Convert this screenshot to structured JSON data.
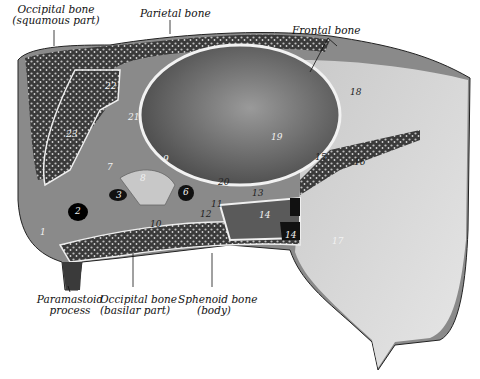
{
  "figure": {
    "style": "grayscale engraving"
  },
  "labels": {
    "occipital_squamous": {
      "line1": "Occipital bone",
      "line2": "(squamous part)"
    },
    "parietal": {
      "line1": "Parietal bone"
    },
    "frontal": {
      "line1": "Frontal bone"
    },
    "paramastoid": {
      "line1": "Paramastoid",
      "line2": "process"
    },
    "occipital_basilar": {
      "line1": "Occipital bone",
      "line2": "(basilar part)"
    },
    "sphenoid_body": {
      "line1": "Sphenoid bone",
      "line2": "(body)"
    }
  },
  "numbers": [
    {
      "id": "n1",
      "text": "1"
    },
    {
      "id": "n2",
      "text": "2"
    },
    {
      "id": "n3",
      "text": "3"
    },
    {
      "id": "n6",
      "text": "6"
    },
    {
      "id": "n7",
      "text": "7"
    },
    {
      "id": "n8",
      "text": "8"
    },
    {
      "id": "n9",
      "text": "9"
    },
    {
      "id": "n10",
      "text": "10"
    },
    {
      "id": "n11",
      "text": "11"
    },
    {
      "id": "n12",
      "text": "12"
    },
    {
      "id": "n13",
      "text": "13"
    },
    {
      "id": "n14a",
      "text": "14"
    },
    {
      "id": "n14b",
      "text": "14"
    },
    {
      "id": "n15",
      "text": "15"
    },
    {
      "id": "n16",
      "text": "16"
    },
    {
      "id": "n17",
      "text": "17"
    },
    {
      "id": "n18",
      "text": "18"
    },
    {
      "id": "n19",
      "text": "19"
    },
    {
      "id": "n20",
      "text": "20"
    },
    {
      "id": "n21",
      "text": "21"
    },
    {
      "id": "n22",
      "text": "22"
    },
    {
      "id": "n23",
      "text": "23"
    }
  ]
}
